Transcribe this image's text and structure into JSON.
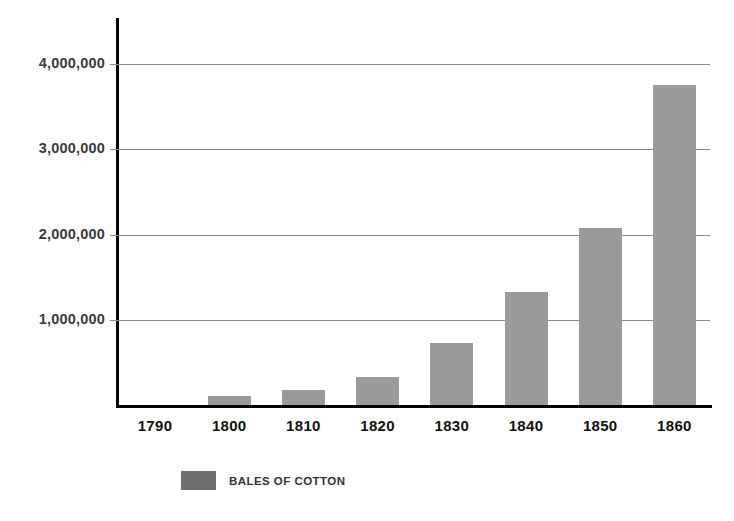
{
  "chart_data": {
    "type": "bar",
    "title": "",
    "subtitle": "",
    "xlabel": "",
    "ylabel": "",
    "categories": [
      "1790",
      "1800",
      "1810",
      "1820",
      "1830",
      "1840",
      "1850",
      "1860"
    ],
    "values": [
      0,
      100000,
      180000,
      330000,
      730000,
      1330000,
      2080000,
      3750000
    ],
    "series": [
      {
        "name": "BALES OF COTTON",
        "values": [
          0,
          100000,
          180000,
          330000,
          730000,
          1330000,
          2080000,
          3750000
        ]
      }
    ],
    "ylim": [
      0,
      4130000
    ],
    "ytick_values": [
      1000000,
      2000000,
      3000000,
      4000000
    ],
    "ytick_labels": [
      "1,000,000",
      "2,000,000",
      "3,000,000",
      "4,000,000"
    ],
    "grid": true,
    "legend_position": "bottom-left",
    "legend": [
      {
        "label": "BALES OF COTTON",
        "color": "#6e6e6e"
      }
    ],
    "bar_color": "#9a9a9a",
    "axis_color": "#000000",
    "gridline_color": "#8a8a8a",
    "tick_label_color": "#111111"
  }
}
